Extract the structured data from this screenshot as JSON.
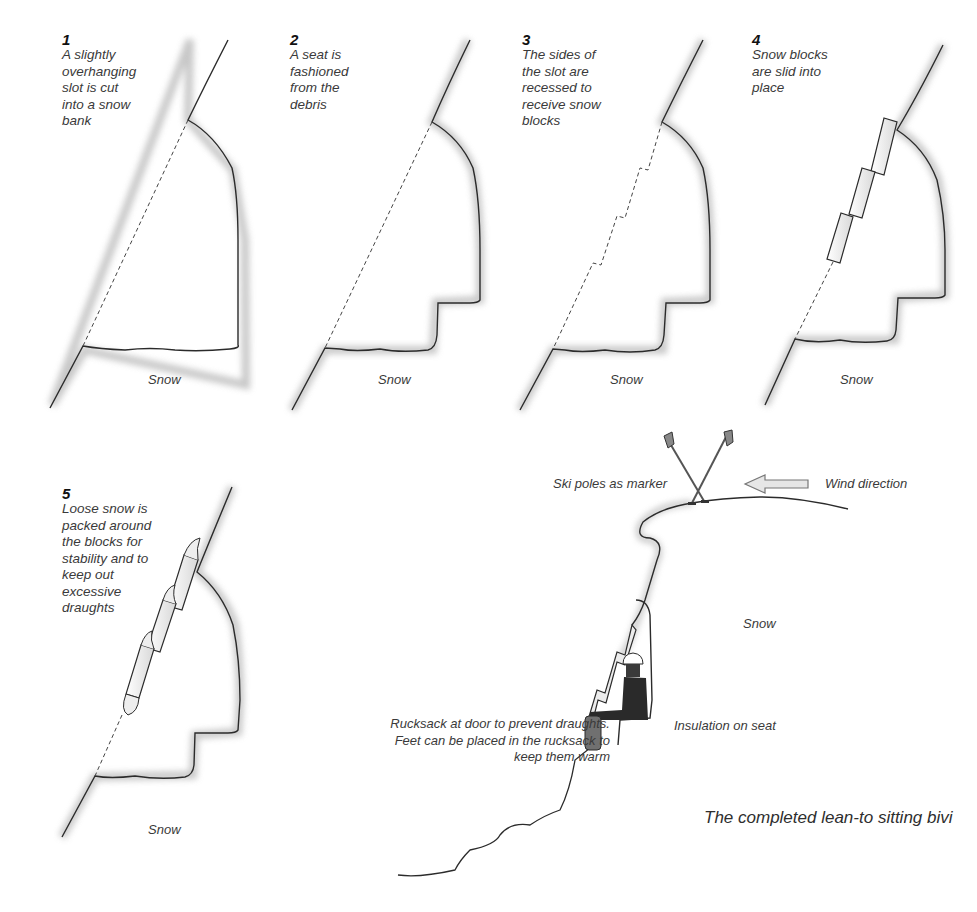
{
  "steps": [
    {
      "number": "1",
      "text": "A slightly overhanging slot is cut into a snow bank",
      "lines": [
        "A slightly",
        "overhanging",
        "slot is cut",
        "into a snow",
        "bank"
      ],
      "ground_label": "Snow"
    },
    {
      "number": "2",
      "text": "A seat is fashioned from the debris",
      "lines": [
        "A seat is",
        "fashioned",
        "from the",
        "debris"
      ],
      "ground_label": "Snow"
    },
    {
      "number": "3",
      "text": "The sides of the slot are recessed to receive snow blocks",
      "lines": [
        "The sides of",
        "the slot are",
        "recessed to",
        "receive snow",
        "blocks"
      ],
      "ground_label": "Snow"
    },
    {
      "number": "4",
      "text": "Snow blocks are slid into place",
      "lines": [
        "Snow blocks",
        "are slid into",
        "place"
      ],
      "ground_label": "Snow"
    },
    {
      "number": "5",
      "text": "Loose snow is packed around the blocks for stability and to keep out excessive draughts",
      "lines": [
        "Loose snow is",
        "packed around",
        "the blocks for",
        "stability and to",
        "keep out",
        "excessive",
        "draughts"
      ],
      "ground_label": "Snow"
    }
  ],
  "completed": {
    "title": "The completed lean-to sitting bivi",
    "labels": {
      "ski_poles": "Ski poles as marker",
      "wind": "Wind direction",
      "snow": "Snow",
      "rucksack_lines": [
        "Rucksack at door to prevent draughts.",
        "Feet can be placed in the rucksack to",
        "keep them warm"
      ],
      "insulation": "Insulation on seat"
    }
  },
  "colors": {
    "outline": "#2b2b2b",
    "shadow": "#9a9a9a",
    "block_fill": "#f2f2f2",
    "clothing": "#2a2a2a",
    "background": "#ffffff"
  }
}
